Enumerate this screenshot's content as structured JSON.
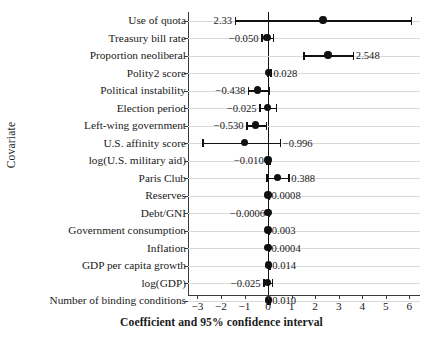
{
  "chart_data": {
    "type": "scatter",
    "title": "",
    "xlabel": "Coefficient and 95% confidence interval",
    "ylabel": "Covariate",
    "xlim": [
      -3.4,
      6.45
    ],
    "xticks": [
      -3,
      -2,
      -1,
      0,
      1,
      2,
      3,
      4,
      5,
      6
    ],
    "xtick_labels": [
      "−3",
      "−2",
      "−1",
      "0",
      "1",
      "2",
      "3",
      "4",
      "5",
      "6"
    ],
    "grid": true,
    "legend": "none",
    "reference_line": 0,
    "categories": [
      "Use of quota",
      "Treasury bill rate",
      "Proportion neoliberal",
      "Polity2 score",
      "Political instability",
      "Election period",
      "Left-wing government",
      "U.S. affinity score",
      "log(U.S. military aid)",
      "Paris Club",
      "Reserves",
      "Debt/GNI",
      "Government consumption",
      "Inflation",
      "GDP per capita growth",
      "log(GDP)",
      "Number of binding conditions"
    ],
    "points": [
      {
        "category": "Use of quota",
        "estimate": 2.33,
        "label": "2.33",
        "ci_low": -1.42,
        "ci_high": 6.05,
        "label_side": "left"
      },
      {
        "category": "Treasury bill rate",
        "estimate": -0.05,
        "label": "−0.050",
        "ci_low": -0.3,
        "ci_high": 0.2,
        "label_side": "left"
      },
      {
        "category": "Proportion neoliberal",
        "estimate": 2.548,
        "label": "2.548",
        "ci_low": 1.5,
        "ci_high": 3.6,
        "label_side": "right"
      },
      {
        "category": "Polity2 score",
        "estimate": 0.028,
        "label": "0.028",
        "ci_low": -0.04,
        "ci_high": 0.1,
        "label_side": "right"
      },
      {
        "category": "Political instability",
        "estimate": -0.438,
        "label": "−0.438",
        "ci_low": -0.86,
        "ci_high": 0.02,
        "label_side": "left"
      },
      {
        "category": "Election period",
        "estimate": -0.025,
        "label": "−0.025",
        "ci_low": -0.38,
        "ci_high": 0.33,
        "label_side": "left"
      },
      {
        "category": "Left-wing government",
        "estimate": -0.53,
        "label": "−0.530",
        "ci_low": -0.93,
        "ci_high": -0.1,
        "label_side": "left"
      },
      {
        "category": "U.S. affinity score",
        "estimate": -0.996,
        "label": "−0.996",
        "ci_low": -2.8,
        "ci_high": 0.5,
        "label_side": "right"
      },
      {
        "category": "log(U.S. military aid)",
        "estimate": -0.01,
        "label": "−0.010",
        "ci_low": -0.08,
        "ci_high": 0.06,
        "label_side": "left"
      },
      {
        "category": "Paris Club",
        "estimate": 0.388,
        "label": "0.388",
        "ci_low": -0.08,
        "ci_high": 0.86,
        "label_side": "right"
      },
      {
        "category": "Reserves",
        "estimate": 0.0008,
        "label": "0.0008",
        "ci_low": -0.02,
        "ci_high": 0.02,
        "label_side": "right"
      },
      {
        "category": "Debt/GNI",
        "estimate": -0.0006,
        "label": "−0.0006",
        "ci_low": -0.02,
        "ci_high": 0.02,
        "label_side": "left"
      },
      {
        "category": "Government consumption",
        "estimate": 0.003,
        "label": "0.003",
        "ci_low": -0.02,
        "ci_high": 0.03,
        "label_side": "right"
      },
      {
        "category": "Inflation",
        "estimate": 0.0004,
        "label": "0.0004",
        "ci_low": -0.02,
        "ci_high": 0.02,
        "label_side": "right"
      },
      {
        "category": "GDP per capita growth",
        "estimate": 0.014,
        "label": "0.014",
        "ci_low": -0.02,
        "ci_high": 0.05,
        "label_side": "right"
      },
      {
        "category": "log(GDP)",
        "estimate": -0.025,
        "label": "−0.025",
        "ci_low": -0.21,
        "ci_high": 0.16,
        "label_side": "left"
      },
      {
        "category": "Number of binding conditions",
        "estimate": 0.01,
        "label": "0.010",
        "ci_low": -0.03,
        "ci_high": 0.05,
        "label_side": "right"
      }
    ],
    "colors": {
      "point": "#111111",
      "interval": "#111111",
      "grid": "#d9d9d9",
      "axis": "#3a3a3a",
      "background": "#ffffff"
    }
  }
}
